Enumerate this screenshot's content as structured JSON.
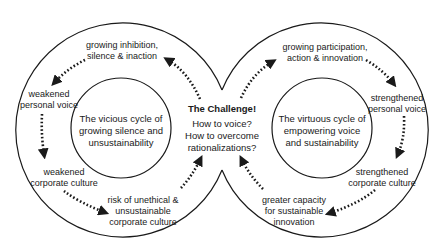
{
  "diagram": {
    "type": "figure-eight two-cycle diagram",
    "colors": {
      "stroke": "#1a1a1a",
      "background": "#ffffff",
      "text": "#1a1a1a"
    },
    "center": {
      "title": "The Challenge!",
      "question_1": "How to voice?",
      "question_2": "How to overcome",
      "question_3": "rationalizations?"
    },
    "vicious_cycle": {
      "core_line_1": "The vicious cycle of",
      "core_line_2": "growing silence and",
      "core_line_3": "unsustainability",
      "steps": [
        {
          "line_1": "growing inhibition,",
          "line_2": "silence & inaction"
        },
        {
          "line_1": "weakened",
          "line_2": "personal voice"
        },
        {
          "line_1": "weakened",
          "line_2": "corporate culture"
        },
        {
          "line_1": "risk of unethical &",
          "line_2": "unsustainable",
          "line_3": "corporate culture"
        }
      ]
    },
    "virtuous_cycle": {
      "core_line_1": "The virtuous cycle of",
      "core_line_2": "empowering voice",
      "core_line_3": "and sustainability",
      "steps": [
        {
          "line_1": "growing participation,",
          "line_2": "action & innovation"
        },
        {
          "line_1": "strengthened",
          "line_2": "personal voice"
        },
        {
          "line_1": "strengthened",
          "line_2": "corporate culture"
        },
        {
          "line_1": "greater capacity",
          "line_2": "for sustainable",
          "line_3": "innovation"
        }
      ]
    },
    "arrow_style": "dotted",
    "arrow_flow": [
      "The Challenge -> growing inhibition, silence & inaction",
      "growing inhibition -> weakened personal voice",
      "weakened personal voice -> weakened corporate culture",
      "weakened corporate culture -> risk of unethical & unsustainable corporate culture",
      "risk of unethical -> The Challenge",
      "The Challenge -> growing participation, action & innovation",
      "growing participation -> strengthened personal voice",
      "strengthened personal voice -> strengthened corporate culture",
      "strengthened corporate culture -> greater capacity for sustainable innovation",
      "greater capacity -> The Challenge"
    ]
  }
}
